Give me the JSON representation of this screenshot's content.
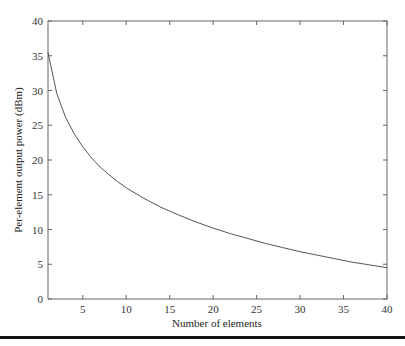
{
  "chart_data": {
    "type": "line",
    "title": "",
    "xlabel": "Number of elements",
    "ylabel": "Per-element output power (dBm)",
    "xlim": [
      1,
      40
    ],
    "ylim": [
      0,
      40
    ],
    "xticks": [
      5,
      10,
      15,
      20,
      25,
      30,
      35,
      40
    ],
    "yticks": [
      0,
      5,
      10,
      15,
      20,
      25,
      30,
      35,
      40
    ],
    "grid": false,
    "legend": null,
    "series": [
      {
        "name": "Per-element output power",
        "x": [
          1,
          2,
          3,
          4,
          5,
          6,
          7,
          8,
          9,
          10,
          12,
          14,
          16,
          18,
          20,
          22,
          24,
          26,
          28,
          30,
          32,
          34,
          36,
          38,
          40
        ],
        "values": [
          35.5,
          29.6,
          26.2,
          23.8,
          21.9,
          20.3,
          19.0,
          17.9,
          16.9,
          16.0,
          14.5,
          13.2,
          12.1,
          11.1,
          10.2,
          9.4,
          8.7,
          8.0,
          7.4,
          6.8,
          6.3,
          5.8,
          5.3,
          4.9,
          4.5
        ]
      }
    ]
  }
}
